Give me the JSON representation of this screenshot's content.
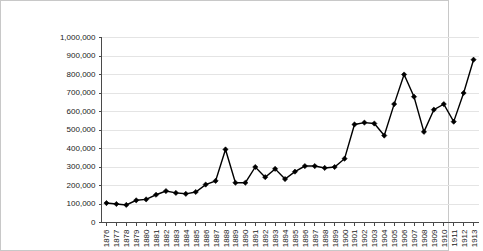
{
  "chart_data": {
    "type": "line",
    "title": "",
    "subtitle": "",
    "xlabel": "",
    "ylabel": "",
    "grid": "horizontal",
    "legend": "none",
    "marker": "diamond",
    "line_color": "#000000",
    "grid_color": "#e4e4e4",
    "axis_color": "#4a4a4a",
    "ylim": [
      0,
      1000000
    ],
    "ytick_step": 100000,
    "ytick_labels": [
      "0",
      "100,000",
      "200,000",
      "300,000",
      "400,000",
      "500,000",
      "600,000",
      "700,000",
      "800,000",
      "900,000",
      "1,000,000"
    ],
    "ytick_values": [
      0,
      100000,
      200000,
      300000,
      400000,
      500000,
      600000,
      700000,
      800000,
      900000,
      1000000
    ],
    "categories": [
      "1876",
      "1877",
      "1878",
      "1879",
      "1880",
      "1881",
      "1882",
      "1883",
      "1884",
      "1885",
      "1886",
      "1887",
      "1888",
      "1889",
      "1890",
      "1891",
      "1892",
      "1893",
      "1894",
      "1895",
      "1896",
      "1897",
      "1898",
      "1899",
      "1900",
      "1901",
      "1902",
      "1903",
      "1904",
      "1905",
      "1906",
      "1907",
      "1908",
      "1909",
      "1910",
      "1911",
      "1912",
      "1913"
    ],
    "values": [
      105000,
      100000,
      95000,
      120000,
      125000,
      150000,
      170000,
      160000,
      155000,
      165000,
      205000,
      225000,
      395000,
      215000,
      215000,
      300000,
      245000,
      290000,
      235000,
      275000,
      305000,
      305000,
      295000,
      300000,
      345000,
      530000,
      540000,
      535000,
      470000,
      640000,
      800000,
      680000,
      490000,
      610000,
      640000,
      545000,
      700000,
      880000
    ]
  }
}
